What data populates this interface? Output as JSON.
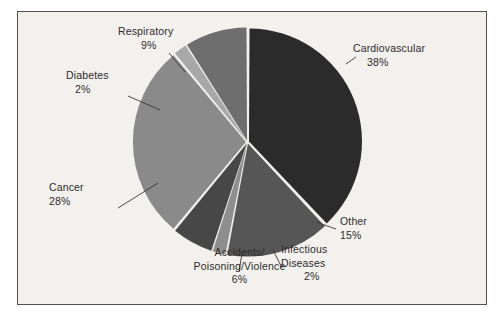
{
  "figure": {
    "background_color": "#ffffff",
    "panel_color": "#f2f1ee",
    "border_color": "#55514e"
  },
  "chart_data": {
    "type": "pie",
    "title": "",
    "subtitle": "",
    "xlabel": "",
    "ylabel": "",
    "legend_position": "none",
    "grid": false,
    "units": "percent",
    "start_angle_deg": 0,
    "direction": "clockwise",
    "categories": [
      "Cardiovascular",
      "Other",
      "Infectious Diseases",
      "Accidents/Poisoning/Violence",
      "Cancer",
      "Diabetes",
      "Respiratory"
    ],
    "values": [
      38,
      15,
      2,
      6,
      28,
      2,
      9
    ],
    "colors": [
      "#2b2b2b",
      "#565656",
      "#8e8e8e",
      "#474747",
      "#8a8a8a",
      "#a8a8a8",
      "#6e6e6e"
    ],
    "slices": [
      {
        "name": "Cardiovascular",
        "value": 38,
        "label": "Cardiovascular",
        "percent_label": "38%",
        "color": "#2b2b2b"
      },
      {
        "name": "Other",
        "value": 15,
        "label": "Other",
        "percent_label": "15%",
        "color": "#565656"
      },
      {
        "name": "Infectious Diseases",
        "value": 2,
        "label": "Infectious",
        "label_line2": "Diseases",
        "percent_label": "2%",
        "color": "#8e8e8e"
      },
      {
        "name": "Accidents/Poisoning/Violence",
        "value": 6,
        "label": "Accidents/",
        "label_line2": "Poisoning/Violence",
        "percent_label": "6%",
        "color": "#474747"
      },
      {
        "name": "Cancer",
        "value": 28,
        "label": "Cancer",
        "percent_label": "28%",
        "color": "#8a8a8a"
      },
      {
        "name": "Diabetes",
        "value": 2,
        "label": "Diabetes",
        "percent_label": "2%",
        "color": "#a8a8a8"
      },
      {
        "name": "Respiratory",
        "value": 9,
        "label": "Respiratory",
        "percent_label": "9%",
        "color": "#6e6e6e"
      }
    ]
  },
  "labels": {
    "cardiovascular": {
      "name": "Cardiovascular",
      "pct": "38%"
    },
    "other": {
      "name": "Other",
      "pct": "15%"
    },
    "infectious": {
      "line1": "Infectious",
      "line2": "Diseases",
      "pct": "2%"
    },
    "accidents": {
      "line1": "Accidents/",
      "line2": "Poisoning/Violence",
      "pct": "6%"
    },
    "cancer": {
      "name": "Cancer",
      "pct": "28%"
    },
    "diabetes": {
      "name": "Diabetes",
      "pct": "2%"
    },
    "respiratory": {
      "name": "Respiratory",
      "pct": "9%"
    }
  }
}
